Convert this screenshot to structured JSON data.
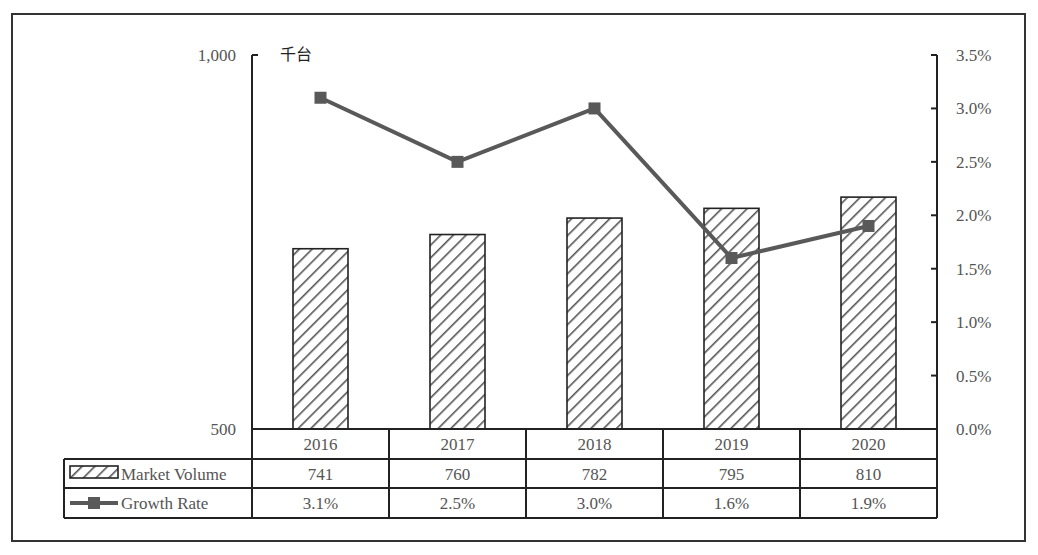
{
  "chart_data": {
    "type": "bar",
    "title": "",
    "unit_label": "千台",
    "categories": [
      "2016",
      "2017",
      "2018",
      "2019",
      "2020"
    ],
    "series": [
      {
        "name": "Market Volume",
        "type": "bar",
        "axis": "left",
        "pattern": "diagonal-hatch",
        "values": [
          741,
          760,
          782,
          795,
          810
        ],
        "labels": [
          "741",
          "760",
          "782",
          "795",
          "810"
        ]
      },
      {
        "name": "Growth Rate",
        "type": "line",
        "axis": "right",
        "marker": "square",
        "color": "#595959",
        "values": [
          3.1,
          2.5,
          3.0,
          1.6,
          1.9
        ],
        "labels": [
          "3.1%",
          "2.5%",
          "3.0%",
          "1.6%",
          "1.9%"
        ]
      }
    ],
    "left_axis": {
      "ylim": [
        500,
        1000
      ],
      "ticks": [
        500,
        1000
      ],
      "tick_labels": [
        "500",
        "1,000"
      ]
    },
    "right_axis": {
      "ylim": [
        0,
        3.5
      ],
      "ticks": [
        0,
        0.5,
        1.0,
        1.5,
        2.0,
        2.5,
        3.0,
        3.5
      ],
      "tick_labels": [
        "0.0%",
        "0.5%",
        "1.0%",
        "1.5%",
        "2.0%",
        "2.5%",
        "3.0%",
        "3.5%"
      ]
    },
    "xlabel": "",
    "ylabel": "千台",
    "grid": false,
    "legend": "data-table",
    "data_table": {
      "header": [
        "2016",
        "2017",
        "2018",
        "2019",
        "2020"
      ],
      "rows": [
        {
          "legend": "Market Volume",
          "cells": [
            "741",
            "760",
            "782",
            "795",
            "810"
          ]
        },
        {
          "legend": "Growth Rate",
          "cells": [
            "3.1%",
            "2.5%",
            "3.0%",
            "1.6%",
            "1.9%"
          ]
        }
      ]
    }
  },
  "colors": {
    "line": "#595959",
    "axis": "#222222",
    "text": "#555555",
    "hatch": "#444444"
  }
}
